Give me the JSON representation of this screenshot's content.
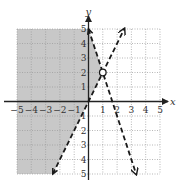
{
  "chart_data": {
    "type": "line",
    "title": "",
    "xlabel": "x",
    "ylabel": "y",
    "xlim": [
      -5,
      5
    ],
    "ylim": [
      -5,
      5
    ],
    "grid": true,
    "grid_style": "dotted",
    "x_ticks": [
      -5,
      -4,
      -3,
      -2,
      -1,
      1,
      2,
      3,
      4,
      5
    ],
    "y_ticks": [
      -5,
      -4,
      -3,
      -2,
      -1,
      1,
      2,
      3,
      4,
      5
    ],
    "x_tick_labels": [
      "−5",
      "−4",
      "−3",
      "−2",
      "−1",
      "1",
      "2",
      "3",
      "4",
      "5"
    ],
    "y_tick_labels": [
      "5",
      "4",
      "3",
      "2",
      "1",
      "1",
      "2",
      "3",
      "4",
      "5"
    ],
    "series": [
      {
        "name": "y = 2x",
        "style": "dashed",
        "slope": 2,
        "intercept": 0,
        "points": [
          [
            -2.5,
            -5
          ],
          [
            0,
            0
          ],
          [
            1,
            2
          ],
          [
            2.5,
            5
          ]
        ],
        "arrows": "both"
      },
      {
        "name": "y = -3x + 5",
        "style": "dashed",
        "slope": -3,
        "intercept": 5,
        "points": [
          [
            0,
            5
          ],
          [
            1,
            2
          ],
          [
            3.33,
            -5
          ]
        ],
        "arrows": "both"
      }
    ],
    "annotations": [
      {
        "type": "open-circle",
        "x": 1,
        "y": 2,
        "label": "intersection"
      }
    ],
    "shaded_region": {
      "description": "y > 2x and y < -3x + 5",
      "polygon": [
        [
          -5,
          5
        ],
        [
          0,
          5
        ],
        [
          1,
          2
        ],
        [
          -2.5,
          -5
        ],
        [
          -5,
          -5
        ]
      ],
      "color": "#c8c8c8"
    }
  },
  "colors": {
    "shade": "#c8c8c8",
    "grid": "#9a9a9a",
    "axis": "#222222",
    "line": "#1a1a1a"
  }
}
